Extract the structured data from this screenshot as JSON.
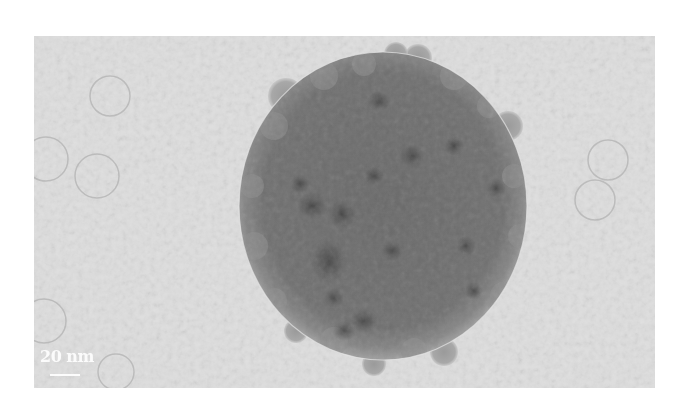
{
  "figure": {
    "type": "TEM micrograph",
    "scale_bar": {
      "label": "20 nm",
      "color": "#ffffff"
    },
    "colors": {
      "background": "#dcdcdc",
      "particle_body": "#6e6e6e",
      "particle_rim": "#8a8a8a",
      "dark_domains": "#4a4a4a",
      "vesicle_outline": "#b8b8b8"
    }
  }
}
